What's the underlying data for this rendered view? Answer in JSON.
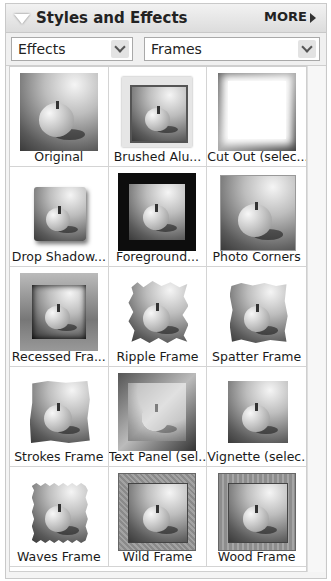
{
  "panel": {
    "title": "Styles and Effects",
    "more_label": "MORE",
    "collapse_icon": "triangle-down-icon",
    "more_icon": "triangle-right-icon"
  },
  "filters": {
    "category": {
      "value": "Effects",
      "icon": "chevron-down-icon"
    },
    "type": {
      "value": "Frames",
      "icon": "chevron-down-icon"
    }
  },
  "items": [
    {
      "label": "Original",
      "style": "original"
    },
    {
      "label": "Brushed Alu...",
      "style": "brushed"
    },
    {
      "label": "Cut Out (selec...",
      "style": "cutout"
    },
    {
      "label": "Drop Shadow...",
      "style": "dropshadow"
    },
    {
      "label": "Foreground...",
      "style": "foreground"
    },
    {
      "label": "Photo Corners",
      "style": "corners"
    },
    {
      "label": "Recessed Fra...",
      "style": "recessed"
    },
    {
      "label": "Ripple Frame",
      "style": "ripple"
    },
    {
      "label": "Spatter Frame",
      "style": "spatter"
    },
    {
      "label": "Strokes Frame",
      "style": "strokes"
    },
    {
      "label": "Text Panel (sel...",
      "style": "textpanel"
    },
    {
      "label": "Vignette (selec...",
      "style": "vignette"
    },
    {
      "label": "Waves Frame",
      "style": "waves"
    },
    {
      "label": "Wild Frame",
      "style": "wild"
    },
    {
      "label": "Wood Frame",
      "style": "wood"
    }
  ]
}
